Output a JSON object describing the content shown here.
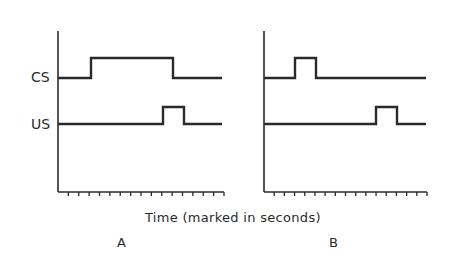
{
  "figure": {
    "axis_title": "Time (marked in seconds)",
    "colors": {
      "ink": "#2a2a2a",
      "background": "#ffffff"
    },
    "signal_labels": {
      "cs": "CS",
      "us": "US"
    },
    "panels": [
      {
        "id": "A",
        "label": "A",
        "axis_x": 58,
        "axis_end_x": 224,
        "cs": {
          "base_y": 78,
          "high_y": 58,
          "on_x": 91,
          "off_x": 173,
          "end_x": 222
        },
        "us": {
          "base_y": 124,
          "high_y": 107,
          "on_x": 163,
          "off_x": 184,
          "end_x": 222
        },
        "tick_count": 16
      },
      {
        "id": "B",
        "label": "B",
        "axis_x": 264,
        "axis_end_x": 427,
        "cs": {
          "base_y": 78,
          "high_y": 58,
          "on_x": 295,
          "off_x": 316,
          "end_x": 426
        },
        "us": {
          "base_y": 124,
          "high_y": 107,
          "on_x": 376,
          "off_x": 397,
          "end_x": 426
        },
        "tick_count": 16
      }
    ]
  }
}
